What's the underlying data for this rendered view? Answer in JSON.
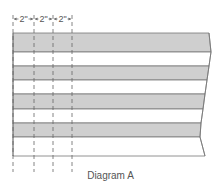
{
  "diagram": {
    "caption": "Diagram A",
    "colors": {
      "stripe_fill": "#cfcfcf",
      "stripe_line": "#777777",
      "dash_line": "#666666",
      "background": "#ffffff"
    },
    "stripes": [
      {
        "type": "shaded"
      },
      {
        "type": "plain"
      },
      {
        "type": "shaded"
      },
      {
        "type": "plain"
      },
      {
        "type": "shaded"
      },
      {
        "type": "plain"
      },
      {
        "type": "shaded"
      },
      {
        "type": "plain"
      }
    ],
    "dimensions": [
      {
        "label": "2\""
      },
      {
        "label": "2\""
      },
      {
        "label": "2\""
      }
    ]
  }
}
